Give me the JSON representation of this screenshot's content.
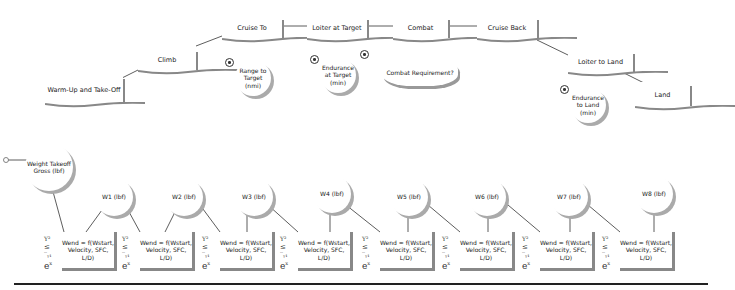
{
  "mission_phases": [
    {
      "label": "Warm-Up and Take-Off",
      "x": 45,
      "y": 75,
      "w": 78,
      "h": 30
    },
    {
      "label": "Climb",
      "x": 138,
      "y": 48,
      "w": 58,
      "h": 24
    },
    {
      "label": "Cruise To",
      "x": 222,
      "y": 16,
      "w": 60,
      "h": 24
    },
    {
      "label": "Loiter at Target",
      "x": 307,
      "y": 16,
      "w": 60,
      "h": 24
    },
    {
      "label": "Combat",
      "x": 393,
      "y": 16,
      "w": 55,
      "h": 24
    },
    {
      "label": "Cruise Back",
      "x": 477,
      "y": 16,
      "w": 60,
      "h": 24
    },
    {
      "label": "Loiter to Land",
      "x": 568,
      "y": 50,
      "w": 65,
      "h": 24
    },
    {
      "label": "Land",
      "x": 635,
      "y": 82,
      "w": 55,
      "h": 26
    }
  ],
  "requirements": [
    {
      "label": "Range to Target (nmi)",
      "x": 235,
      "y": 58
    },
    {
      "label": "Endurance at Target (min)",
      "x": 320,
      "y": 55
    },
    {
      "label": "Endurance to Land (min)",
      "x": 570,
      "y": 85
    }
  ],
  "combat_requirement": {
    "label": "Combat Requirement?"
  },
  "weights": [
    {
      "label": "Weight Takeoff Gross (lbf)",
      "x": 25,
      "y": 143,
      "d": 48
    },
    {
      "label": "W1 (lbf)",
      "x": 95,
      "y": 178,
      "d": 38
    },
    {
      "label": "W2 (lbf)",
      "x": 165,
      "y": 178,
      "d": 38
    },
    {
      "label": "W3 (lbf)",
      "x": 235,
      "y": 178,
      "d": 38
    },
    {
      "label": "W4 (lbf)",
      "x": 313,
      "y": 175,
      "d": 38
    },
    {
      "label": "W5 (lbf)",
      "x": 390,
      "y": 178,
      "d": 38
    },
    {
      "label": "W6 (lbf)",
      "x": 468,
      "y": 178,
      "d": 38
    },
    {
      "label": "W7 (lbf)",
      "x": 550,
      "y": 178,
      "d": 38
    },
    {
      "label": "W8 (lbf)",
      "x": 635,
      "y": 175,
      "d": 38
    }
  ],
  "segment_eq": {
    "label": "Wend = f(Wstart, Velocity, SFC, L/D)",
    "formula": "Y² ≤ -ᵧ₁ / eˣ"
  },
  "segments": [
    {
      "x": 62
    },
    {
      "x": 140
    },
    {
      "x": 220
    },
    {
      "x": 298
    },
    {
      "x": 380
    },
    {
      "x": 460
    },
    {
      "x": 540
    },
    {
      "x": 620
    }
  ]
}
